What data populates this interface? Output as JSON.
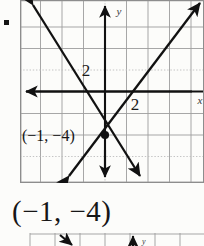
{
  "problem": {
    "bullet_marker": "square-bullet",
    "answer_text": "(−1, −4)"
  },
  "graph": {
    "type": "cartesian-coordinate-plane",
    "axis_labels": {
      "x": "x",
      "y": "y"
    },
    "tick_labels": {
      "x_tick": "2",
      "y_tick": "2"
    },
    "point_label": "(−1, −4)",
    "grid": {
      "spacing_px": 21.5,
      "solid_color": "#9a9a9a",
      "dotted_color": "#b9b9b9",
      "show_grid": true
    },
    "colors": {
      "axis": "#111111",
      "line": "#111111",
      "background": "#fcfcfa",
      "border": "#8d8d8d"
    },
    "solution_point": {
      "x": -1,
      "y": -4,
      "label": "(−1, −4)"
    },
    "lines": [
      {
        "name": "descending-line",
        "direction": "upper-left to lower-right",
        "slope": "negative",
        "arrow_start": "up-left",
        "arrow_end": "down-right"
      },
      {
        "name": "ascending-line",
        "direction": "lower-left to upper-right",
        "slope": "positive",
        "arrow_start": "down-left",
        "arrow_end": "up-right"
      }
    ]
  },
  "next_problem": {
    "bullet_marker": "square-bullet",
    "axis_label_y": "y"
  }
}
